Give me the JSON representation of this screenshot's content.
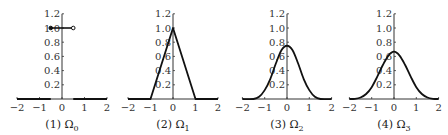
{
  "chart_data": [
    {
      "type": "line",
      "title": "",
      "caption": "(1) Ω₀",
      "caption_num": "(1)",
      "caption_sym": "Ω",
      "caption_sub": "0",
      "xlabel": "",
      "ylabel": "",
      "xlim": [
        -2,
        2
      ],
      "ylim": [
        0,
        1.2
      ],
      "xticks": [
        -2,
        -1,
        0,
        1,
        2
      ],
      "yticks": [
        0.2,
        0.4,
        0.6,
        0.8,
        1.0,
        1.2
      ],
      "grid": false,
      "series": [
        {
          "name": "Ω0",
          "kind": "step",
          "x": [
            -2,
            -0.5,
            -0.5,
            0.5,
            0.5,
            2
          ],
          "y": [
            0,
            0,
            1,
            1,
            0,
            0
          ],
          "markers": [
            {
              "x": -0.5,
              "y": 1,
              "style": "filled"
            },
            {
              "x": 0.5,
              "y": 1,
              "style": "open"
            }
          ]
        }
      ]
    },
    {
      "type": "line",
      "caption": "(2) Ω₁",
      "caption_num": "(2)",
      "caption_sym": "Ω",
      "caption_sub": "1",
      "xlim": [
        -2,
        2
      ],
      "ylim": [
        0,
        1.2
      ],
      "xticks": [
        -2,
        -1,
        0,
        1,
        2
      ],
      "yticks": [
        0.2,
        0.4,
        0.6,
        0.8,
        1.0,
        1.2
      ],
      "grid": false,
      "series": [
        {
          "name": "Ω1",
          "x": [
            -2,
            -1,
            0,
            1,
            2
          ],
          "y": [
            0,
            0,
            1,
            0,
            0
          ]
        }
      ]
    },
    {
      "type": "line",
      "caption": "(3) Ω₂",
      "caption_num": "(3)",
      "caption_sym": "Ω",
      "caption_sub": "2",
      "xlim": [
        -2,
        2
      ],
      "ylim": [
        0,
        1.2
      ],
      "xticks": [
        -2,
        -1,
        0,
        1,
        2
      ],
      "yticks": [
        0.2,
        0.4,
        0.6,
        0.8,
        1.0,
        1.2
      ],
      "grid": false,
      "series": [
        {
          "name": "Ω2",
          "x": [
            -2,
            -1.5,
            -1.25,
            -1,
            -0.75,
            -0.5,
            -0.25,
            0,
            0.25,
            0.5,
            0.75,
            1,
            1.25,
            1.5,
            2
          ],
          "y": [
            0,
            0,
            0.03125,
            0.125,
            0.28125,
            0.5,
            0.6875,
            0.75,
            0.6875,
            0.5,
            0.28125,
            0.125,
            0.03125,
            0,
            0
          ]
        }
      ]
    },
    {
      "type": "line",
      "caption": "(4) Ω₃",
      "caption_num": "(4)",
      "caption_sym": "Ω",
      "caption_sub": "3",
      "xlim": [
        -2,
        2
      ],
      "ylim": [
        0,
        1.2
      ],
      "xticks": [
        -2,
        -1,
        0,
        1,
        2
      ],
      "yticks": [
        0.2,
        0.4,
        0.6,
        0.8,
        1.0,
        1.2
      ],
      "grid": false,
      "series": [
        {
          "name": "Ω3",
          "x": [
            -2,
            -1.75,
            -1.5,
            -1.25,
            -1,
            -0.75,
            -0.5,
            -0.25,
            0,
            0.25,
            0.5,
            0.75,
            1,
            1.25,
            1.5,
            1.75,
            2
          ],
          "y": [
            0,
            0.0026,
            0.0208,
            0.0703,
            0.1667,
            0.3151,
            0.4792,
            0.612,
            0.6667,
            0.612,
            0.4792,
            0.3151,
            0.1667,
            0.0703,
            0.0208,
            0.0026,
            0
          ]
        }
      ]
    }
  ],
  "layout": {
    "panels": [
      {
        "x_origin": 62,
        "x_scale": 22.5
      },
      {
        "x_origin": 173,
        "x_scale": 22.5
      },
      {
        "x_origin": 287,
        "x_scale": 22.3
      },
      {
        "x_origin": 394,
        "x_scale": 22.3
      }
    ],
    "baseline_y": 99,
    "y_scale_per_unit": 71,
    "line_color": "#111111",
    "axis_color": "#333333"
  }
}
